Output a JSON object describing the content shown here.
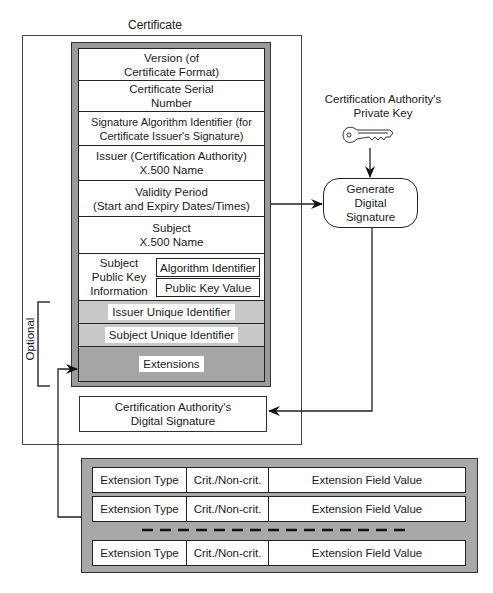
{
  "certificate": {
    "title": "Certificate",
    "fields": [
      {
        "line1": "Version (of",
        "line2": "Certificate Format)"
      },
      {
        "line1": "Certificate Serial",
        "line2": "Number"
      },
      {
        "line1": "Signature Algorithm Identifier (for",
        "line2": "Certificate Issuer's Signature)"
      },
      {
        "line1": "Issuer (Certification Authority)",
        "line2": "X.500 Name"
      },
      {
        "line1": "Validity Period",
        "line2": "(Start and Expiry Dates/Times)"
      },
      {
        "line1": "Subject",
        "line2": "X.500 Name"
      }
    ],
    "spki": {
      "label_line1": "Subject",
      "label_line2": "Public Key",
      "label_line3": "Information",
      "algorithm": "Algorithm Identifier",
      "public_key": "Public Key Value"
    },
    "issuer_uid": "Issuer Unique Identifier",
    "subject_uid": "Subject Unique Identifier",
    "extensions": "Extensions",
    "optional_label": "Optional",
    "ca_signature": {
      "line1": "Certification Authority's",
      "line2": "Digital Signature"
    }
  },
  "ca_private_key": {
    "line1": "Certification Authority's",
    "line2": "Private Key",
    "icon": "key-icon"
  },
  "generate": {
    "line1": "Generate",
    "line2": "Digital",
    "line3": "Signature"
  },
  "extension_rows": [
    {
      "type": "Extension Type",
      "crit": "Crit./Non-crit.",
      "value": "Extension Field Value"
    },
    {
      "type": "Extension Type",
      "crit": "Crit./Non-crit.",
      "value": "Extension Field Value"
    },
    {
      "type": "Extension Type",
      "crit": "Crit./Non-crit.",
      "value": "Extension Field Value"
    }
  ],
  "colors": {
    "block_gray": "#9a9a9a",
    "light_gray": "#c8c8c8",
    "dark_gray": "#a6a6a6",
    "ext_gray": "#a8a8a8"
  }
}
